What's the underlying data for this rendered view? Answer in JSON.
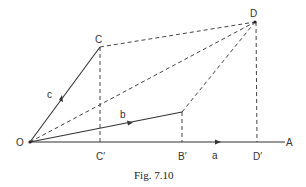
{
  "figure": {
    "caption": "Fig. 7.10",
    "points": {
      "O": {
        "label": "O",
        "x": 30,
        "y": 142
      },
      "C": {
        "label": "C",
        "x": 100,
        "y": 47
      },
      "D": {
        "label": "D",
        "x": 255,
        "y": 22
      },
      "B": {
        "label": "",
        "x": 182,
        "y": 112
      },
      "C_prime": {
        "label": "C′",
        "x": 100,
        "y": 142
      },
      "B_prime": {
        "label": "B′",
        "x": 182,
        "y": 142
      },
      "D_prime": {
        "label": "D′",
        "x": 257,
        "y": 142
      },
      "A": {
        "label": "A",
        "x": 285,
        "y": 142
      }
    },
    "vectors": {
      "a": {
        "label": "a",
        "from": "O",
        "to": "A"
      },
      "b": {
        "label": "b",
        "from": "O",
        "to": "B"
      },
      "c": {
        "label": "c",
        "from": "O",
        "to": "C"
      }
    },
    "dashed_lines": [
      [
        "C",
        "D"
      ],
      [
        "O",
        "D"
      ],
      [
        "B",
        "D"
      ],
      [
        "C",
        "C_prime"
      ],
      [
        "B",
        "B_prime"
      ],
      [
        "D",
        "D_prime"
      ]
    ]
  }
}
